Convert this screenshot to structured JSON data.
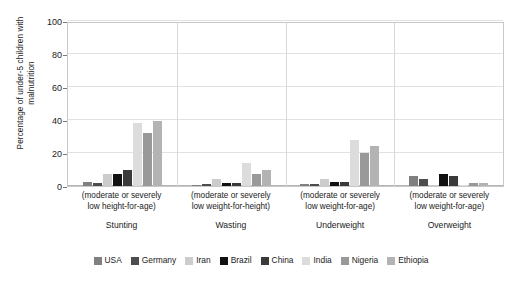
{
  "chart_data": {
    "type": "bar",
    "title": "",
    "xlabel": "",
    "ylabel": "Percentage of under-5 children with malnutrition",
    "ylim": [
      0,
      100
    ],
    "yticks": [
      0,
      20,
      40,
      60,
      80,
      100
    ],
    "grid": true,
    "legend_position": "bottom",
    "categories": [
      "Stunting",
      "Wasting",
      "Underweight",
      "Overweight"
    ],
    "category_sublabels": [
      "(moderate or severely low height-for-age)",
      "(moderate or severely low weight-for-height)",
      "(moderate or severely low weight-for-age)",
      "(moderate or severely low weight-for-age)"
    ],
    "category_sublabel_lines": [
      [
        "(moderate or severely",
        "low height-for-age)"
      ],
      [
        "(moderate or severely",
        "low weight-for-height)"
      ],
      [
        "(moderate or severely",
        "low weight-for-age)"
      ],
      [
        "(moderate or severely",
        "low weight-for-age)"
      ]
    ],
    "series": [
      {
        "name": "USA",
        "color": "#808080",
        "values": [
          2.5,
          0.5,
          1.0,
          6.0
        ]
      },
      {
        "name": "Germany",
        "color": "#4d4d4d",
        "values": [
          1.8,
          1.0,
          1.0,
          4.0
        ]
      },
      {
        "name": "Iran",
        "color": "#cccccc",
        "values": [
          7.0,
          4.0,
          4.0,
          0.0
        ]
      },
      {
        "name": "Brazil",
        "color": "#111111",
        "values": [
          7.5,
          2.0,
          2.2,
          7.0
        ]
      },
      {
        "name": "China",
        "color": "#3a3a3a",
        "values": [
          9.5,
          2.0,
          2.4,
          6.0
        ]
      },
      {
        "name": "India",
        "color": "#dcdcdc",
        "values": [
          38.0,
          14.0,
          28.0,
          0.0
        ]
      },
      {
        "name": "Nigeria",
        "color": "#999999",
        "values": [
          32.0,
          7.5,
          20.0,
          2.0
        ]
      },
      {
        "name": "Ethiopia",
        "color": "#b3b3b3",
        "values": [
          39.5,
          10.0,
          24.0,
          2.0
        ]
      }
    ]
  }
}
